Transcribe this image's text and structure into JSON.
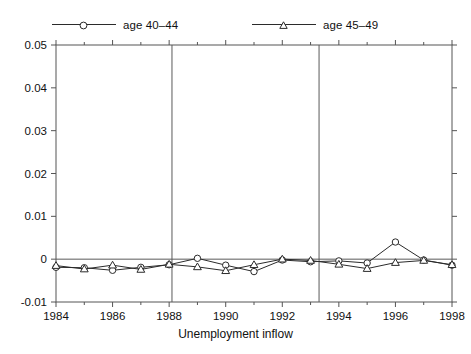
{
  "chart_data": {
    "type": "line",
    "title": "",
    "xlabel": "Unemployment inflow",
    "ylabel": "",
    "xlim": [
      1984,
      1998
    ],
    "ylim": [
      -0.01,
      0.05
    ],
    "x_ticks": [
      1984,
      1986,
      1988,
      1990,
      1992,
      1994,
      1996,
      1998
    ],
    "x_tick_labels": [
      "1984",
      "1986",
      "1988",
      "1990",
      "1992",
      "1994",
      "1996",
      "1998"
    ],
    "x_minor_ticks": [
      1985,
      1987,
      1989,
      1991,
      1993,
      1995,
      1997
    ],
    "y_ticks": [
      -0.01,
      0,
      0.01,
      0.02,
      0.03,
      0.04,
      0.05
    ],
    "y_tick_labels": [
      "-0.01",
      "0",
      "0.01",
      "0.02",
      "0.03",
      "0.04",
      "0.05"
    ],
    "grid": false,
    "legend_position": "above-plot",
    "zero_line": 0,
    "vertical_reference_lines": [
      1988.1,
      1993.3
    ],
    "x": [
      1984,
      1985,
      1986,
      1987,
      1988,
      1989,
      1990,
      1991,
      1992,
      1993,
      1994,
      1995,
      1996,
      1997,
      1998
    ],
    "series": [
      {
        "name": "age 40–44",
        "marker": "circle",
        "values": [
          -0.0019,
          -0.002,
          -0.0026,
          -0.0019,
          -0.0013,
          0.0002,
          -0.0014,
          -0.0029,
          -0.0002,
          -0.0006,
          -0.0004,
          -0.0009,
          0.004,
          -0.0002,
          -0.0014
        ]
      },
      {
        "name": "age 45–49",
        "marker": "triangle",
        "values": [
          -0.0015,
          -0.0023,
          -0.0014,
          -0.0024,
          -0.0012,
          -0.0018,
          -0.0027,
          -0.0013,
          0.0,
          -0.0003,
          -0.0012,
          -0.0022,
          -0.0008,
          -0.0003,
          -0.0013
        ]
      }
    ]
  },
  "legend": {
    "entries": [
      {
        "label": "age 40–44",
        "marker": "circle"
      },
      {
        "label": "age 45–49",
        "marker": "triangle"
      }
    ]
  },
  "axis": {
    "x_title": "Unemployment inflow"
  },
  "colors": {
    "line": "#2b2b2b",
    "axis": "#555555",
    "text": "#111111",
    "reference_line": "#5a5a5a",
    "background": "#ffffff"
  }
}
